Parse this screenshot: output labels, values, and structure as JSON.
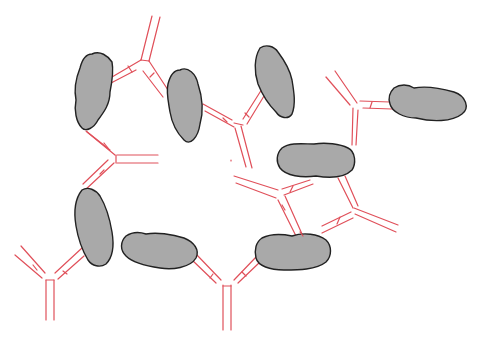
{
  "diagram": {
    "colors": {
      "antibody": "#e0505a",
      "antigen_fill": "#a9a9a9",
      "antigen_stroke": "#222222",
      "background": "#ffffff"
    },
    "antigen_count": 9,
    "antibody_count": 9
  }
}
